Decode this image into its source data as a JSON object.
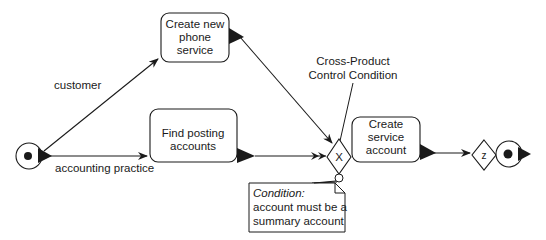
{
  "diagram": {
    "type": "activity-flow",
    "colors": {
      "stroke": "#1a1a1a",
      "background": "#ffffff"
    },
    "nodes": {
      "start": {
        "kind": "initial-state"
      },
      "create_phone_service": {
        "kind": "activity",
        "lines": [
          "Create new",
          "phone",
          "service"
        ]
      },
      "find_posting_accounts": {
        "kind": "activity",
        "lines": [
          "Find posting",
          "accounts"
        ]
      },
      "cross_product_gate": {
        "kind": "decision",
        "symbol": "X"
      },
      "create_service_account": {
        "kind": "activity",
        "lines": [
          "Create",
          "service",
          "account"
        ]
      },
      "z_gate": {
        "kind": "decision",
        "symbol": "z"
      },
      "end": {
        "kind": "final-state"
      }
    },
    "edges": {
      "customer": {
        "from": "start",
        "to": "create_phone_service",
        "label": "customer"
      },
      "accounting_practice": {
        "from": "start",
        "to": "find_posting_accounts",
        "label": "accounting practice"
      },
      "phone_to_gate": {
        "from": "create_phone_service",
        "to": "cross_product_gate"
      },
      "find_to_gate": {
        "from": "find_posting_accounts",
        "to": "cross_product_gate"
      },
      "gate_to_create": {
        "from": "cross_product_gate",
        "to": "create_service_account"
      },
      "create_to_z": {
        "from": "create_service_account",
        "to": "z_gate"
      },
      "z_to_end": {
        "from": "z_gate",
        "to": "end"
      }
    },
    "annotations": {
      "gate_label": {
        "lines": [
          "Cross-Product",
          "Control Condition"
        ]
      },
      "note": {
        "title": "Condition:",
        "lines": [
          "account must be a",
          "summary account"
        ]
      }
    }
  }
}
